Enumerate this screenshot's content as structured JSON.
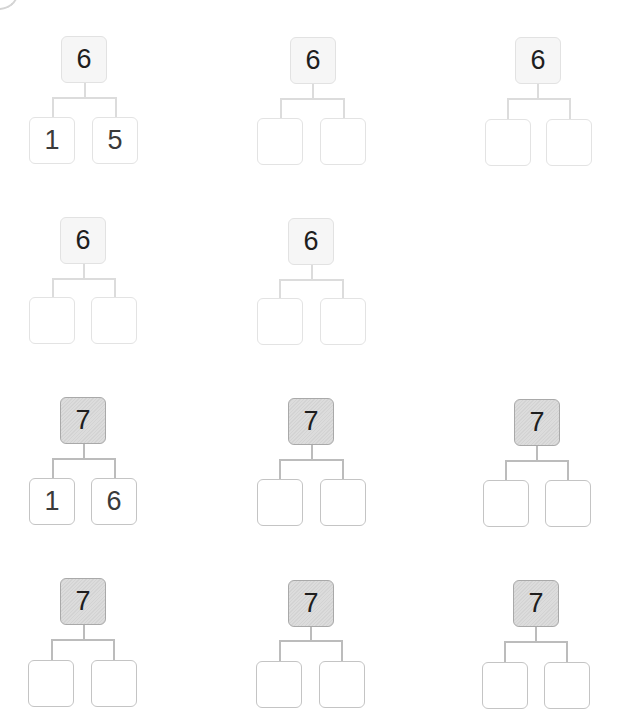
{
  "worksheet": {
    "rows": [
      {
        "style": "light",
        "trees": [
          {
            "whole": "6",
            "parts": [
              "1",
              "5"
            ]
          },
          {
            "whole": "6",
            "parts": [
              "",
              ""
            ]
          },
          {
            "whole": "6",
            "parts": [
              "",
              ""
            ]
          }
        ]
      },
      {
        "style": "light",
        "trees": [
          {
            "whole": "6",
            "parts": [
              "",
              ""
            ]
          },
          {
            "whole": "6",
            "parts": [
              "",
              ""
            ]
          }
        ]
      },
      {
        "style": "dark",
        "trees": [
          {
            "whole": "7",
            "parts": [
              "1",
              "6"
            ]
          },
          {
            "whole": "7",
            "parts": [
              "",
              ""
            ]
          },
          {
            "whole": "7",
            "parts": [
              "",
              ""
            ]
          }
        ]
      },
      {
        "style": "dark",
        "trees": [
          {
            "whole": "7",
            "parts": [
              "",
              ""
            ]
          },
          {
            "whole": "7",
            "parts": [
              "",
              ""
            ]
          },
          {
            "whole": "7",
            "parts": [
              "",
              ""
            ]
          }
        ]
      }
    ]
  },
  "colors": {
    "light_box_fill": "#f6f6f6",
    "dark_box_fill": "#d8d8d8",
    "light_line": "#dcdcdc",
    "dark_line": "#bcbcbc"
  }
}
